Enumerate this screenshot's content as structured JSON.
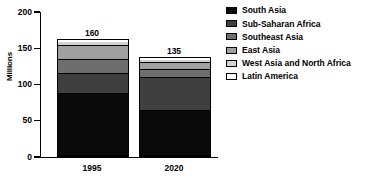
{
  "chart_data": {
    "type": "bar",
    "subtype": "stacked-bar",
    "title": "",
    "xlabel": "",
    "ylabel": "Millions",
    "categories": [
      "1995",
      "2020"
    ],
    "ylim": [
      0,
      200
    ],
    "yticks": [
      0,
      50,
      100,
      150,
      200
    ],
    "ytick_labels": [
      "0",
      "50",
      "100",
      "150",
      "200"
    ],
    "grid": false,
    "legend_position": "right",
    "bar_totals": [
      160,
      135
    ],
    "series": [
      {
        "name": "South Asia",
        "color": "#0a0a0a",
        "values": [
          85,
          62
        ]
      },
      {
        "name": "Sub-Saharan Africa",
        "color": "#3f3f3f",
        "values": [
          28,
          46
        ]
      },
      {
        "name": "Southeast Asia",
        "color": "#6e6e6e",
        "values": [
          20,
          10
        ]
      },
      {
        "name": "East Asia",
        "color": "#a0a0a0",
        "values": [
          19,
          10
        ]
      },
      {
        "name": "West Asia and North Africa",
        "color": "#d2d2d2",
        "values": [
          5,
          5
        ]
      },
      {
        "name": "Latin America",
        "color": "#ffffff",
        "values": [
          3,
          2
        ]
      }
    ]
  }
}
